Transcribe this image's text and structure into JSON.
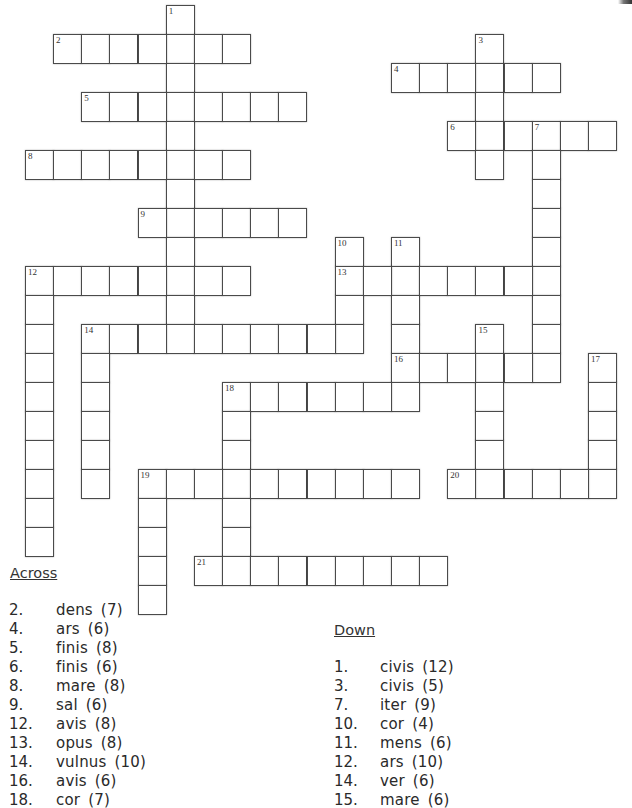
{
  "puzzle": {
    "grid_origin": {
      "x": 25,
      "y": 5
    },
    "cell_size": {
      "w": 28.15,
      "h": 29
    },
    "words": [
      {
        "number": 1,
        "dir": "down",
        "col": 5,
        "row": 0,
        "length": 12
      },
      {
        "number": 2,
        "dir": "across",
        "col": 1,
        "row": 1,
        "length": 7
      },
      {
        "number": 3,
        "dir": "down",
        "col": 16,
        "row": 1,
        "length": 5
      },
      {
        "number": 4,
        "dir": "across",
        "col": 13,
        "row": 2,
        "length": 6
      },
      {
        "number": 5,
        "dir": "across",
        "col": 2,
        "row": 3,
        "length": 8
      },
      {
        "number": 6,
        "dir": "across",
        "col": 15,
        "row": 4,
        "length": 6
      },
      {
        "number": 7,
        "dir": "down",
        "col": 18,
        "row": 4,
        "length": 9
      },
      {
        "number": 8,
        "dir": "across",
        "col": 0,
        "row": 5,
        "length": 8
      },
      {
        "number": 9,
        "dir": "across",
        "col": 4,
        "row": 7,
        "length": 6
      },
      {
        "number": 10,
        "dir": "down",
        "col": 11,
        "row": 8,
        "length": 4
      },
      {
        "number": 11,
        "dir": "down",
        "col": 13,
        "row": 8,
        "length": 6
      },
      {
        "number": 12,
        "dir": "across",
        "col": 0,
        "row": 9,
        "length": 8
      },
      {
        "number": 12,
        "dir": "down",
        "col": 0,
        "row": 9,
        "length": 10
      },
      {
        "number": 13,
        "dir": "across",
        "col": 11,
        "row": 9,
        "length": 8
      },
      {
        "number": 14,
        "dir": "across",
        "col": 2,
        "row": 11,
        "length": 10
      },
      {
        "number": 14,
        "dir": "down",
        "col": 2,
        "row": 11,
        "length": 6
      },
      {
        "number": 15,
        "dir": "down",
        "col": 16,
        "row": 11,
        "length": 6
      },
      {
        "number": 16,
        "dir": "across",
        "col": 13,
        "row": 12,
        "length": 6
      },
      {
        "number": 17,
        "dir": "down",
        "col": 20,
        "row": 12,
        "length": 5
      },
      {
        "number": 18,
        "dir": "across",
        "col": 7,
        "row": 13,
        "length": 7
      },
      {
        "number": 18,
        "dir": "down",
        "col": 7,
        "row": 13,
        "length": 6
      },
      {
        "number": 19,
        "dir": "across",
        "col": 4,
        "row": 16,
        "length": 10
      },
      {
        "number": 19,
        "dir": "down",
        "col": 4,
        "row": 16,
        "length": 5
      },
      {
        "number": 20,
        "dir": "across",
        "col": 15,
        "row": 16,
        "length": 6
      },
      {
        "number": 21,
        "dir": "across",
        "col": 6,
        "row": 19,
        "length": 9
      }
    ]
  },
  "clues": {
    "across_heading": "Across",
    "down_heading": "Down",
    "across": [
      {
        "number": "2.",
        "text": "dens (7)"
      },
      {
        "number": "4.",
        "text": "ars (6)"
      },
      {
        "number": "5.",
        "text": "finis (8)"
      },
      {
        "number": "6.",
        "text": "finis (6)"
      },
      {
        "number": "8.",
        "text": "mare (8)"
      },
      {
        "number": "9.",
        "text": "sal (6)"
      },
      {
        "number": "12.",
        "text": "avis (8)"
      },
      {
        "number": "13.",
        "text": "opus (8)"
      },
      {
        "number": "14.",
        "text": "vulnus (10)"
      },
      {
        "number": "16.",
        "text": "avis (6)"
      },
      {
        "number": "18.",
        "text": "cor (7)"
      }
    ],
    "down": [
      {
        "number": "1.",
        "text": "civis (12)"
      },
      {
        "number": "3.",
        "text": "civis (5)"
      },
      {
        "number": "7.",
        "text": "iter (9)"
      },
      {
        "number": "10.",
        "text": "cor (4)"
      },
      {
        "number": "11.",
        "text": "mens (6)"
      },
      {
        "number": "12.",
        "text": "ars (10)"
      },
      {
        "number": "14.",
        "text": "ver (6)"
      },
      {
        "number": "15.",
        "text": "mare (6)"
      }
    ]
  }
}
